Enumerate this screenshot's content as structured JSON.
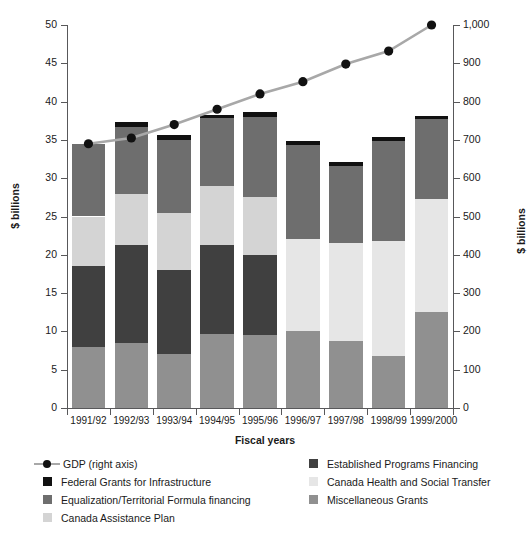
{
  "figure": {
    "cropped_top_text": "",
    "xlabel": "Fiscal years",
    "ylabel_left": "$ billions",
    "ylabel_right": "$ billions"
  },
  "axes": {
    "left_ticks": [
      "0",
      "5",
      "10",
      "15",
      "20",
      "25",
      "30",
      "35",
      "40",
      "45",
      "50"
    ],
    "right_ticks": [
      "0",
      "100",
      "200",
      "300",
      "400",
      "500",
      "600",
      "700",
      "800",
      "900",
      "1,000"
    ]
  },
  "legend": {
    "left_items": [
      {
        "label": "GDP (right axis)",
        "kind": "line-marker",
        "color": "#a8a8a8",
        "marker_color": "#111111"
      },
      {
        "label": "Federal Grants for Infrastructure",
        "kind": "swatch",
        "color": "#111111"
      },
      {
        "label": "Equalization/Territorial Formula financing",
        "kind": "swatch",
        "color": "#6e6e6e"
      },
      {
        "label": "Canada Assistance Plan",
        "kind": "swatch",
        "color": "#d4d4d4"
      }
    ],
    "right_items": [
      {
        "label": "Established Programs Financing",
        "kind": "swatch",
        "color": "#404040"
      },
      {
        "label": "Canada Health and Social Transfer",
        "kind": "swatch",
        "color": "#e6e6e6"
      },
      {
        "label": "Miscellaneous Grants",
        "kind": "swatch",
        "color": "#909090"
      }
    ]
  },
  "chart_data": {
    "type": "bar",
    "title": "",
    "xlabel": "Fiscal years",
    "ylabel": "$ billions",
    "ylabel_secondary": "$ billions",
    "ylim": [
      0,
      50
    ],
    "ylim_secondary": [
      0,
      1000
    ],
    "ytick_step": 5,
    "ytick_step_secondary": 100,
    "grid": false,
    "legend_position": "bottom",
    "stacked": true,
    "categories": [
      "1991/92",
      "1992/93",
      "1993/94",
      "1994/95",
      "1995/96",
      "1996/97",
      "1997/98",
      "1998/99",
      "1999/2000"
    ],
    "series": [
      {
        "name": "Miscellaneous Grants",
        "color": "#909090",
        "values": [
          8.0,
          8.5,
          7.0,
          9.6,
          9.5,
          10.0,
          8.8,
          6.8,
          12.5
        ]
      },
      {
        "name": "Established Programs Financing",
        "color": "#404040",
        "values": [
          10.5,
          12.8,
          11.0,
          11.7,
          10.5,
          0,
          0,
          0,
          0
        ]
      },
      {
        "name": "Canada Assistance Plan",
        "color": "#d4d4d4",
        "values": [
          6.5,
          6.7,
          7.5,
          7.7,
          7.5,
          0,
          0,
          0,
          0
        ]
      },
      {
        "name": "Canada Health and Social Transfer",
        "color": "#e6e6e6",
        "values": [
          0,
          0,
          0,
          0,
          0,
          12.0,
          12.8,
          15.0,
          14.8
        ]
      },
      {
        "name": "Equalization/Territorial Formula financing",
        "color": "#6e6e6e",
        "values": [
          9.5,
          8.7,
          9.5,
          8.8,
          10.5,
          12.3,
          10.0,
          13.0,
          10.4
        ]
      },
      {
        "name": "Federal Grants for Infrastructure",
        "color": "#111111",
        "values": [
          0,
          0.6,
          0.6,
          0.5,
          0.6,
          0.6,
          0.5,
          0.6,
          0.4
        ]
      }
    ],
    "totals": [
      34.5,
      37.3,
      35.6,
      38.3,
      38.6,
      34.9,
      32.1,
      35.4,
      38.1
    ],
    "overlay_line": {
      "name": "GDP (right axis)",
      "axis": "secondary",
      "color": "#a8a8a8",
      "marker_color": "#111111",
      "values": [
        690,
        705,
        740,
        780,
        820,
        852,
        898,
        932,
        1000
      ]
    }
  }
}
